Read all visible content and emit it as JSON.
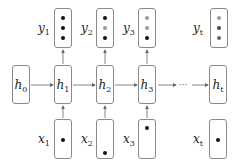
{
  "diagram": {
    "type": "recurrent-neural-network-unrolled",
    "colors": {
      "box_border": "#8a8a8a",
      "arrow": "#666666",
      "dot_dark": "#111111",
      "dot_gray": "#9a9a9a"
    },
    "hidden": [
      {
        "var": "h",
        "sub": "0"
      },
      {
        "var": "h",
        "sub": "1"
      },
      {
        "var": "h",
        "sub": "2"
      },
      {
        "var": "h",
        "sub": "3"
      },
      {
        "var": "h",
        "sub": "t"
      }
    ],
    "outputs": [
      {
        "var": "y",
        "sub": "1",
        "dots": [
          "dark",
          "dark",
          "dark"
        ]
      },
      {
        "var": "y",
        "sub": "2",
        "dots": [
          "dark",
          "gray",
          "dark"
        ]
      },
      {
        "var": "y",
        "sub": "3",
        "dots": [
          "gray",
          "gray",
          "dark"
        ]
      },
      {
        "var": "y",
        "sub": "t",
        "dots": [
          "gray",
          "dark",
          "gray"
        ]
      }
    ],
    "inputs": [
      {
        "var": "x",
        "sub": "1",
        "dot_position": "middle"
      },
      {
        "var": "x",
        "sub": "2",
        "dot_position": "bottom"
      },
      {
        "var": "x",
        "sub": "3",
        "dot_position": "top"
      },
      {
        "var": "x",
        "sub": "t",
        "dot_position": "middle"
      }
    ],
    "ellipsis": "···"
  }
}
